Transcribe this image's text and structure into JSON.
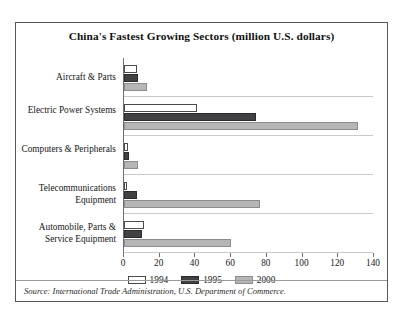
{
  "chart_data": {
    "type": "bar",
    "orientation": "horizontal",
    "title": "China's Fastest Growing Sectors (million U.S. dollars)",
    "xlabel": "",
    "ylabel": "",
    "xlim": [
      0,
      140
    ],
    "xticks": [
      0,
      20,
      40,
      60,
      80,
      100,
      120,
      140
    ],
    "grid": false,
    "legend_position": "bottom",
    "categories": [
      "Aircraft & Parts",
      "Electric Power Systems",
      "Computers & Peripherals",
      "Telecommunications Equipment",
      "Automobile, Parts & Service Equipment"
    ],
    "series": [
      {
        "name": "1994",
        "color": "#ffffff",
        "values": [
          7,
          41,
          2,
          1,
          11
        ]
      },
      {
        "name": "1995",
        "color": "#414143",
        "values": [
          8,
          74,
          3,
          7,
          10
        ]
      },
      {
        "name": "2000",
        "color": "#b6b6b6",
        "values": [
          13,
          131,
          8,
          76,
          60
        ]
      }
    ]
  },
  "source": {
    "text": "Source: International Trade Administration, U.S. Department of Commerce."
  }
}
